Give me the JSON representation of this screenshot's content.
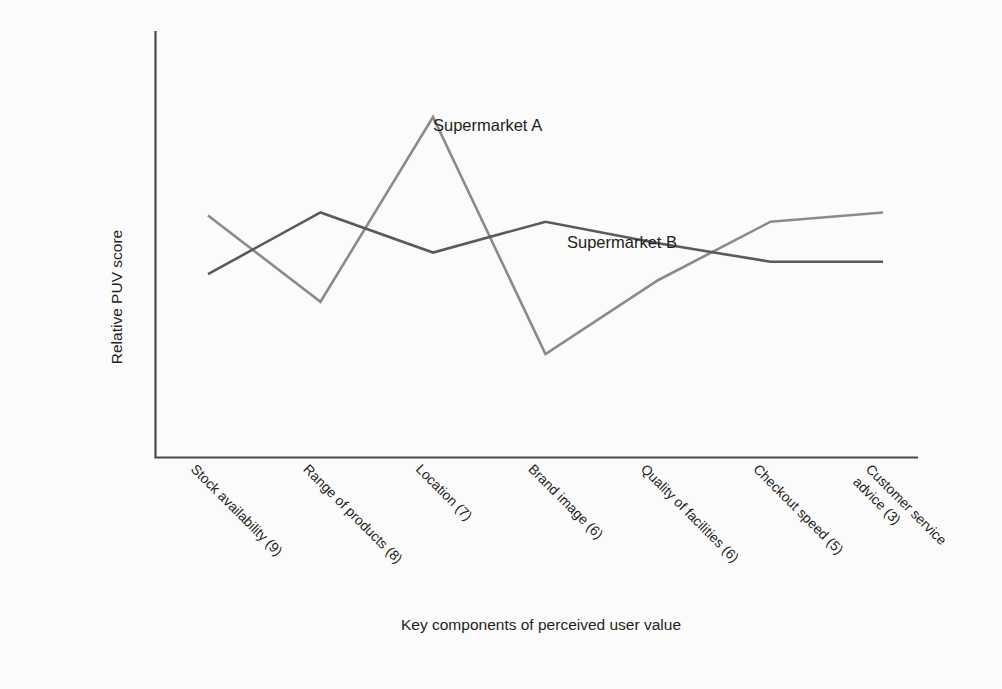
{
  "chart_data": {
    "type": "line",
    "title": "",
    "xlabel": "Key components of perceived user value",
    "ylabel": "Relative PUV score",
    "grid": false,
    "legend_position": "inline-annotation",
    "axis_ranges": {
      "x": [
        0,
        8
      ],
      "y": [
        0,
        10
      ]
    },
    "categories": [
      "Stock availability (9)",
      "Range of products (8)",
      "Location (7)",
      "Brand image (6)",
      "Quality of facilities (6)",
      "Checkout speed (5)",
      "Customer service advice (3)"
    ],
    "category_lines": [
      [
        "Stock availability (9)"
      ],
      [
        "Range of products (8)"
      ],
      [
        "Location (7)"
      ],
      [
        "Brand image (6)"
      ],
      [
        "Quality of facilities (6)"
      ],
      [
        "Checkout speed (5)"
      ],
      [
        "Customer service",
        "advice (3)"
      ]
    ],
    "series": [
      {
        "name": "Supermarket A",
        "color": "#8b8b8b",
        "values": [
          6.8,
          4.0,
          10.0,
          2.3,
          4.7,
          6.6,
          6.9
        ],
        "label_anchor_index": 2
      },
      {
        "name": "Supermarket B",
        "color": "#5a5a5a",
        "values": [
          4.9,
          6.9,
          5.6,
          6.6,
          5.9,
          5.3,
          5.3
        ],
        "label_anchor_index": 4
      }
    ],
    "annotations": [
      {
        "text": "Supermarket A",
        "series": "Supermarket A"
      },
      {
        "text": "Supermarket B",
        "series": "Supermarket B"
      }
    ]
  },
  "colors": {
    "background": "#fbfbfb",
    "axis": "#4a4a4a",
    "text": "#231f20",
    "series_a": "#8b8b8b",
    "series_b": "#5a5a5a"
  }
}
